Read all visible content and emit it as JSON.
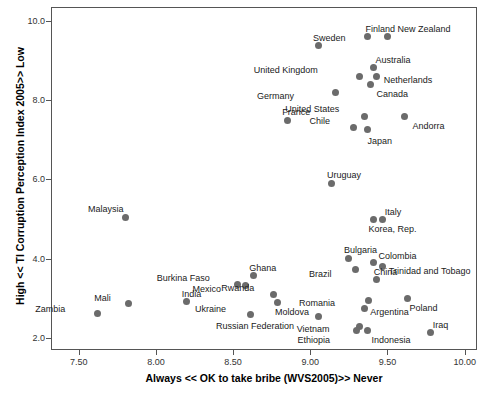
{
  "chart_data": {
    "type": "scatter",
    "title": "",
    "xlabel": "Always << OK to take bribe (WVS2005)>> Never",
    "ylabel": "High << TI Corruption Perception Index 2005>> Low",
    "xlim": [
      7.32,
      10.08
    ],
    "ylim": [
      1.7,
      10.35
    ],
    "xticks": [
      7.5,
      8.0,
      8.5,
      9.0,
      9.5,
      10.0
    ],
    "xtick_labels": [
      "7.50",
      "8.00",
      "8.50",
      "9.00",
      "9.50",
      "10.00"
    ],
    "yticks": [
      2.0,
      4.0,
      6.0,
      8.0,
      10.0
    ],
    "ytick_labels": [
      "2.0",
      "4.0",
      "6.0",
      "8.0",
      "10.0"
    ],
    "grid": false,
    "legend": "none",
    "marker_color": "#6b6b6b",
    "marker_shape": "circle",
    "points": [
      {
        "label": "Finland",
        "x": 9.37,
        "y": 9.6,
        "lx": -2,
        "ly": -13
      },
      {
        "label": "New Zealand",
        "x": 9.5,
        "y": 9.6,
        "lx": 10,
        "ly": -13
      },
      {
        "label": "Sweden",
        "x": 9.05,
        "y": 9.37,
        "lx": -5,
        "ly": -13
      },
      {
        "label": "Australia",
        "x": 9.41,
        "y": 8.82,
        "lx": 2,
        "ly": -13
      },
      {
        "label": "United Kingdom",
        "x": 9.32,
        "y": 8.6,
        "lx": -48,
        "ly": -11
      },
      {
        "label": "Netherlands",
        "x": 9.43,
        "y": 8.6,
        "lx": 7,
        "ly": -1
      },
      {
        "label": "Canada",
        "x": 9.39,
        "y": 8.4,
        "lx": 6,
        "ly": 5
      },
      {
        "label": "Germany",
        "x": 9.16,
        "y": 8.2,
        "lx": -47,
        "ly": -1
      },
      {
        "label": "United States",
        "x": 9.35,
        "y": 7.6,
        "lx": -31,
        "ly": -12
      },
      {
        "label": "Chile",
        "x": 9.28,
        "y": 7.3,
        "lx": -29,
        "ly": -12
      },
      {
        "label": "France",
        "x": 8.85,
        "y": 7.5,
        "lx": -5,
        "ly": -13
      },
      {
        "label": "Andorra",
        "x": 9.61,
        "y": 7.6,
        "lx": 8,
        "ly": 5
      },
      {
        "label": "Japan",
        "x": 9.37,
        "y": 7.25,
        "lx": 0,
        "ly": 6
      },
      {
        "label": "Uruguay",
        "x": 9.14,
        "y": 5.9,
        "lx": -5,
        "ly": -13
      },
      {
        "label": "Italy",
        "x": 9.47,
        "y": 5.0,
        "lx": 2,
        "ly": -12
      },
      {
        "label": "Korea, Rep.",
        "x": 9.41,
        "y": 5.0,
        "lx": -5,
        "ly": 5
      },
      {
        "label": "Bulgaria",
        "x": 9.25,
        "y": 4.02,
        "lx": -5,
        "ly": -13
      },
      {
        "label": "Colombia",
        "x": 9.41,
        "y": 3.9,
        "lx": 5,
        "ly": -12
      },
      {
        "label": "Trinidad and Tobago",
        "x": 9.47,
        "y": 3.8,
        "lx": 6,
        "ly": -1
      },
      {
        "label": "Brazil",
        "x": 9.29,
        "y": 3.72,
        "lx": -29,
        "ly": -1
      },
      {
        "label": "China",
        "x": 9.43,
        "y": 3.48,
        "lx": -3,
        "ly": -12
      },
      {
        "label": "Ghana",
        "x": 8.63,
        "y": 3.58,
        "lx": -4,
        "ly": -12
      },
      {
        "label": "Burkina Faso",
        "x": 8.53,
        "y": 3.35,
        "lx": -34,
        "ly": -12
      },
      {
        "label": "Mexico",
        "x": 8.58,
        "y": 3.32,
        "lx": -30,
        "ly": -2
      },
      {
        "label": "Rwanda",
        "x": 8.76,
        "y": 3.1,
        "lx": -25,
        "ly": -11
      },
      {
        "label": "India",
        "x": 8.2,
        "y": 2.92,
        "lx": -5,
        "ly": -13
      },
      {
        "label": "Ukraine",
        "x": 8.61,
        "y": 2.6,
        "lx": -30,
        "ly": -10
      },
      {
        "label": "Moldova",
        "x": 8.79,
        "y": 2.9,
        "lx": -3,
        "ly": 5
      },
      {
        "label": "Russian Federation",
        "x": 9.05,
        "y": 2.55,
        "lx": -30,
        "ly": 5
      },
      {
        "label": "Romania",
        "x": 9.38,
        "y": 2.95,
        "lx": -40,
        "ly": -2
      },
      {
        "label": "Poland",
        "x": 9.63,
        "y": 3.0,
        "lx": 2,
        "ly": 5
      },
      {
        "label": "Argentina",
        "x": 9.35,
        "y": 2.75,
        "lx": 6,
        "ly": -1
      },
      {
        "label": "Vietnam",
        "x": 9.32,
        "y": 2.3,
        "lx": -36,
        "ly": -2
      },
      {
        "label": "Ethiopia",
        "x": 9.3,
        "y": 2.2,
        "lx": -32,
        "ly": 5
      },
      {
        "label": "Indonesia",
        "x": 9.37,
        "y": 2.2,
        "lx": 4,
        "ly": 5
      },
      {
        "label": "Iraq",
        "x": 9.78,
        "y": 2.15,
        "lx": 2,
        "ly": -12
      },
      {
        "label": "Malaysia",
        "x": 7.8,
        "y": 5.05,
        "lx": -7,
        "ly": -13
      },
      {
        "label": "Mali",
        "x": 7.82,
        "y": 2.88,
        "lx": -23,
        "ly": -10
      },
      {
        "label": "Zambia",
        "x": 7.62,
        "y": 2.62,
        "lx": -38,
        "ly": -10
      }
    ]
  }
}
